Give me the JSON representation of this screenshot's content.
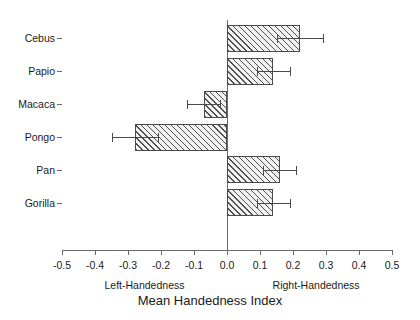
{
  "chart_data": {
    "type": "bar",
    "orientation": "horizontal",
    "title": "",
    "xlabel": "Mean Handedness Index",
    "ylabel": "",
    "xlim": [
      -0.5,
      0.5
    ],
    "grid": false,
    "legend": null,
    "xticks": [
      "-0.5",
      "-0.4",
      "-0.3",
      "-0.2",
      "-0.1",
      "0.0",
      "0.1",
      "0.2",
      "0.3",
      "0.4",
      "0.5"
    ],
    "xtick_values": [
      -0.5,
      -0.4,
      -0.3,
      -0.2,
      -0.1,
      0.0,
      0.1,
      0.2,
      0.3,
      0.4,
      0.5
    ],
    "categories": [
      "Cebus",
      "Papio",
      "Macaca",
      "Pongo",
      "Pan",
      "Gorilla"
    ],
    "values": [
      0.22,
      0.14,
      -0.07,
      -0.28,
      0.16,
      0.14
    ],
    "error_low": [
      0.15,
      0.09,
      -0.12,
      -0.35,
      0.11,
      0.09
    ],
    "error_high": [
      0.29,
      0.19,
      -0.02,
      -0.21,
      0.21,
      0.19
    ],
    "annotations": [
      {
        "text": "Left-Handedness",
        "x": -0.25
      },
      {
        "text": "Right-Handedness",
        "x": 0.27
      }
    ],
    "bar_style": {
      "hatch": "diagonal-45",
      "face_color": "#f2f2f2",
      "edge_color": "#4a4a4a",
      "error_color": "#4a4a4a"
    },
    "axis_color": "#6b6b6b"
  }
}
